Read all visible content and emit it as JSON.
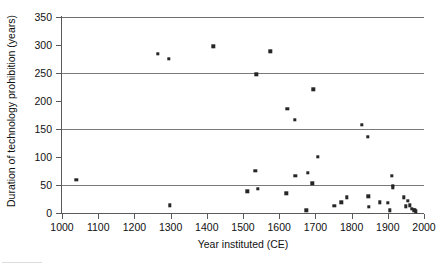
{
  "chart_data": {
    "type": "scatter",
    "title": "",
    "xlabel": "Year instituted (CE)",
    "ylabel": "Duration of technology prohibition (years)",
    "xlim": [
      1000,
      2000
    ],
    "ylim": [
      0,
      350
    ],
    "xticks": [
      1000,
      1100,
      1200,
      1300,
      1400,
      1500,
      1600,
      1700,
      1800,
      1900,
      2000
    ],
    "yticks": [
      0,
      50,
      100,
      150,
      200,
      250,
      300,
      350
    ],
    "grid": "horizontal",
    "gridlines_at": [
      50,
      150,
      250,
      350
    ],
    "legend": "none",
    "marker": "square",
    "marker_color": "#262626",
    "points": [
      {
        "x": 1040,
        "y": 59
      },
      {
        "x": 1265,
        "y": 284
      },
      {
        "x": 1295,
        "y": 275
      },
      {
        "x": 1298,
        "y": 14
      },
      {
        "x": 1418,
        "y": 298
      },
      {
        "x": 1512,
        "y": 39
      },
      {
        "x": 1534,
        "y": 75
      },
      {
        "x": 1537,
        "y": 248
      },
      {
        "x": 1541,
        "y": 43
      },
      {
        "x": 1575,
        "y": 289
      },
      {
        "x": 1620,
        "y": 35
      },
      {
        "x": 1622,
        "y": 186
      },
      {
        "x": 1643,
        "y": 166
      },
      {
        "x": 1645,
        "y": 66
      },
      {
        "x": 1675,
        "y": 5
      },
      {
        "x": 1679,
        "y": 72
      },
      {
        "x": 1691,
        "y": 53
      },
      {
        "x": 1694,
        "y": 221
      },
      {
        "x": 1707,
        "y": 100
      },
      {
        "x": 1752,
        "y": 13
      },
      {
        "x": 1772,
        "y": 19
      },
      {
        "x": 1786,
        "y": 28
      },
      {
        "x": 1828,
        "y": 157
      },
      {
        "x": 1845,
        "y": 136
      },
      {
        "x": 1846,
        "y": 30
      },
      {
        "x": 1848,
        "y": 11
      },
      {
        "x": 1878,
        "y": 19
      },
      {
        "x": 1900,
        "y": 18
      },
      {
        "x": 1906,
        "y": 5
      },
      {
        "x": 1911,
        "y": 66
      },
      {
        "x": 1913,
        "y": 49
      },
      {
        "x": 1914,
        "y": 46
      },
      {
        "x": 1944,
        "y": 28
      },
      {
        "x": 1949,
        "y": 12
      },
      {
        "x": 1955,
        "y": 22
      },
      {
        "x": 1961,
        "y": 14
      },
      {
        "x": 1966,
        "y": 7
      },
      {
        "x": 1971,
        "y": 5
      },
      {
        "x": 1974,
        "y": 6
      },
      {
        "x": 1978,
        "y": 3
      }
    ]
  }
}
